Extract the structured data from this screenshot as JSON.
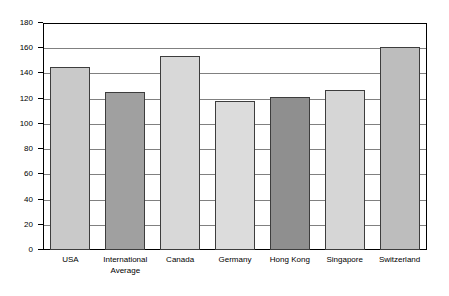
{
  "chart_data": {
    "type": "bar",
    "title": "",
    "subtitle": "",
    "xlabel": "",
    "ylabel": "",
    "categories": [
      "USA",
      "International\nAverage",
      "Canada",
      "Germany",
      "Hong Kong",
      "Singapore",
      "Switzerland"
    ],
    "values": [
      145,
      125,
      154,
      118,
      121,
      127,
      161
    ],
    "ylim": [
      0,
      180
    ],
    "ytick_values": [
      0,
      20,
      40,
      60,
      80,
      100,
      120,
      140,
      160,
      180
    ],
    "ytick_labels": [
      "0",
      "20",
      "40",
      "60",
      "80",
      "100",
      "120",
      "140",
      "160",
      "180"
    ],
    "grid": "horizontal",
    "legend": "none",
    "bar_colors": [
      "#c9c9c9",
      "#a0a0a0",
      "#d8d8d8",
      "#dcdcdc",
      "#8f8f8f",
      "#d6d6d6",
      "#bdbdbd"
    ],
    "bar_edge_color": "#3d3d3d",
    "gridline_color": "#808080",
    "frame_color": "#000000",
    "background_color": "#ffffff"
  }
}
